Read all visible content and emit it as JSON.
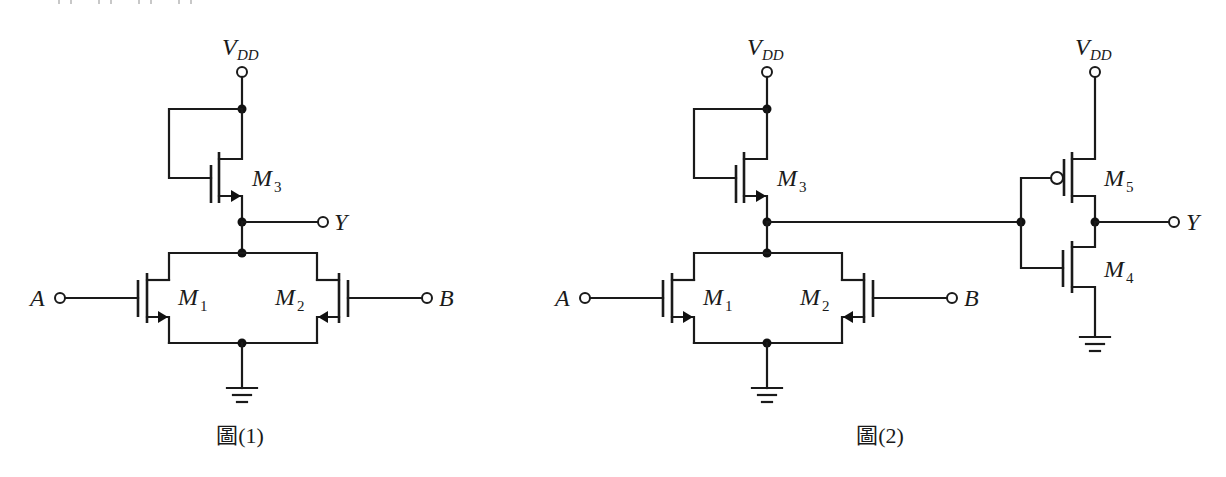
{
  "figures": [
    {
      "id": "fig1",
      "caption": "圖(1)",
      "supply_label": "V",
      "supply_sub": "DD",
      "output_label": "Y",
      "inputs": [
        {
          "label": "A"
        },
        {
          "label": "B"
        }
      ],
      "transistors": [
        {
          "name": "M",
          "index": "3",
          "type": "nmos",
          "role": "load (gate tied to drain/VDD)"
        },
        {
          "name": "M",
          "index": "1",
          "type": "nmos",
          "role": "pull-down, input A"
        },
        {
          "name": "M",
          "index": "2",
          "type": "nmos",
          "role": "pull-down, input B"
        }
      ]
    },
    {
      "id": "fig2",
      "caption": "圖(2)",
      "supply_label": "V",
      "supply_sub": "DD",
      "output_label": "Y",
      "inputs": [
        {
          "label": "A"
        },
        {
          "label": "B"
        }
      ],
      "transistors": [
        {
          "name": "M",
          "index": "3",
          "type": "nmos",
          "role": "load"
        },
        {
          "name": "M",
          "index": "1",
          "type": "nmos",
          "role": "pull-down, input A"
        },
        {
          "name": "M",
          "index": "2",
          "type": "nmos",
          "role": "pull-down, input B"
        },
        {
          "name": "M",
          "index": "5",
          "type": "pmos",
          "role": "inverter pull-up"
        },
        {
          "name": "M",
          "index": "4",
          "type": "nmos",
          "role": "inverter pull-down"
        }
      ],
      "inverter": {
        "supply_label": "V",
        "supply_sub": "DD",
        "output_label": "Y"
      }
    }
  ],
  "colors": {
    "ink": "#1a1a1a",
    "background": "#ffffff"
  }
}
